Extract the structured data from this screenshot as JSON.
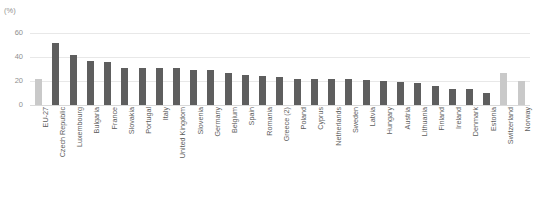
{
  "chart_data": {
    "type": "bar",
    "title": "",
    "unit_label": "(%)",
    "xlabel": "",
    "ylabel": "",
    "ylim": [
      0,
      60
    ],
    "yticks": [
      0,
      20,
      40,
      60
    ],
    "grid": true,
    "legend": "none",
    "categories": [
      "EU-27",
      "Czech Republic",
      "Luxembourg",
      "Bulgaria",
      "France",
      "Slovakia",
      "Portugal",
      "Italy",
      "United Kingdom",
      "Slovenia",
      "Germany",
      "Belgium",
      "Spain",
      "Romania",
      "Greece (2)",
      "Poland",
      "Cyprus",
      "Netherlands",
      "Sweden",
      "Latvia",
      "Hungary",
      "Austria",
      "Lithuania",
      "Finland",
      "Ireland",
      "Denmark",
      "Estonia",
      "Switzerland",
      "Norway"
    ],
    "values": [
      22,
      52,
      42,
      37,
      36,
      31,
      31,
      31,
      31,
      29,
      29,
      27,
      25,
      24,
      23,
      22,
      22,
      22,
      22,
      21,
      20,
      19,
      18,
      16,
      13,
      13,
      10,
      27,
      20
    ],
    "bar_styles": [
      "light",
      "dark",
      "dark",
      "dark",
      "dark",
      "dark",
      "dark",
      "dark",
      "dark",
      "dark",
      "dark",
      "dark",
      "dark",
      "dark",
      "dark",
      "dark",
      "dark",
      "dark",
      "dark",
      "dark",
      "dark",
      "dark",
      "dark",
      "dark",
      "dark",
      "dark",
      "dark",
      "light",
      "light"
    ],
    "colors": {
      "dark_bar": "#5e5e5e",
      "light_bar": "#c9c9c9",
      "gridline": "#e8e8e8",
      "text": "#5c5c5c",
      "axis_text": "#8f8f8f"
    }
  }
}
